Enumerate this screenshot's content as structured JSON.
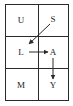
{
  "diagram": {
    "type": "grid-transition",
    "rows": 3,
    "cols": 2,
    "cells": [
      {
        "label": "U",
        "row": 0,
        "col": 0
      },
      {
        "label": "S",
        "row": 0,
        "col": 1
      },
      {
        "label": "L",
        "row": 1,
        "col": 0
      },
      {
        "label": "A",
        "row": 1,
        "col": 1
      },
      {
        "label": "M",
        "row": 2,
        "col": 0
      },
      {
        "label": "Y",
        "row": 2,
        "col": 1
      }
    ],
    "arrows": [
      {
        "from": "S",
        "to": "L"
      },
      {
        "from": "L",
        "to": "A"
      },
      {
        "from": "A",
        "to": "Y"
      }
    ],
    "colors": {
      "line": "#2a2a2a",
      "text": "#222222",
      "background": "#ffffff"
    }
  }
}
